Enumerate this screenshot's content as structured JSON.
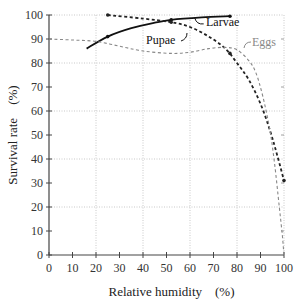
{
  "chart_data": {
    "type": "line",
    "title": "",
    "xlabel": "Relative humidity　(%)",
    "ylabel": "Survival rate　(%)",
    "xlim": [
      0,
      100
    ],
    "ylim": [
      0,
      100
    ],
    "xticks": [
      "0",
      "10",
      "20",
      "30",
      "40",
      "50",
      "60",
      "70",
      "80",
      "90",
      "100"
    ],
    "yticks": [
      "0",
      "10",
      "20",
      "30",
      "40",
      "50",
      "60",
      "70",
      "80",
      "90",
      "100"
    ],
    "grid": true,
    "series": [
      {
        "name": "Larvae",
        "style": "solid",
        "color": "#111111",
        "points": [
          [
            16,
            86
          ],
          [
            25,
            91
          ],
          [
            35,
            94.5
          ],
          [
            45,
            96.8
          ],
          [
            52,
            98
          ],
          [
            65,
            99
          ],
          [
            77,
            99.5
          ]
        ],
        "markers": [
          [
            25,
            91
          ],
          [
            52,
            98
          ],
          [
            77,
            99.5
          ]
        ]
      },
      {
        "name": "Pupae",
        "style": "dashed",
        "color": "#222222",
        "points": [
          [
            25,
            100
          ],
          [
            40,
            98.5
          ],
          [
            52,
            97
          ],
          [
            60,
            95
          ],
          [
            68,
            91
          ],
          [
            75,
            86
          ],
          [
            80,
            80
          ],
          [
            85,
            73
          ],
          [
            90,
            63
          ],
          [
            94,
            52
          ],
          [
            97,
            42
          ],
          [
            100,
            31
          ]
        ],
        "markers": [
          [
            25,
            100
          ],
          [
            52,
            97
          ],
          [
            77,
            84
          ],
          [
            100,
            31
          ]
        ]
      },
      {
        "name": "Eggs",
        "style": "dashed",
        "color": "#888888",
        "points": [
          [
            0,
            90
          ],
          [
            10,
            89.6
          ],
          [
            20,
            89
          ],
          [
            30,
            87
          ],
          [
            40,
            85
          ],
          [
            52,
            84
          ],
          [
            60,
            84.5
          ],
          [
            68,
            86
          ],
          [
            75,
            86.5
          ],
          [
            80,
            85.5
          ],
          [
            85,
            81
          ],
          [
            88,
            76
          ],
          [
            91,
            66
          ],
          [
            94,
            52
          ],
          [
            96,
            38
          ],
          [
            98,
            20
          ],
          [
            99.3,
            8
          ],
          [
            100,
            0
          ]
        ],
        "markers": []
      }
    ],
    "annotations": [
      {
        "text": "Larvae",
        "series": "Larvae"
      },
      {
        "text": "Pupae",
        "series": "Pupae"
      },
      {
        "text": "Eggs",
        "series": "Eggs"
      }
    ]
  }
}
